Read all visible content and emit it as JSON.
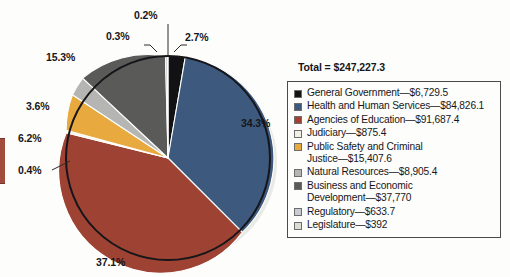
{
  "chart_data": {
    "type": "pie",
    "title": "",
    "total_label": "Total = $247,227.3",
    "total_value": 247227.3,
    "units": "thousands of dollars",
    "legend_position": "right",
    "grid": false,
    "categories": [
      "General Government",
      "Health and Human Services",
      "Agencies of Education",
      "Judiciary",
      "Public Safety and Criminal Justice",
      "Natural Resources",
      "Business and Economic Development",
      "Regulatory",
      "Legislature"
    ],
    "values": [
      6729.5,
      84826.1,
      91687.4,
      875.4,
      15407.6,
      8905.4,
      37770,
      633.7,
      392
    ],
    "value_labels": [
      "$6,729.5",
      "$84,826.1",
      "$91,687.4",
      "$875.4",
      "$15,407.6",
      "$8,905.4",
      "$37,770",
      "$633.7",
      "$392"
    ],
    "percents": [
      2.7,
      34.3,
      37.1,
      0.4,
      6.2,
      3.6,
      15.3,
      0.3,
      0.2
    ],
    "percent_labels": [
      "2.7%",
      "34.3%",
      "37.1%",
      "0.4%",
      "6.2%",
      "3.6%",
      "15.3%",
      "0.3%",
      "0.2%"
    ],
    "colors": [
      "#121214",
      "#3d5a7e",
      "#9e4334",
      "#f2f0e2",
      "#e8a93f",
      "#b5b5b3",
      "#5a5a58",
      "#c8ccd2",
      "#dcdcd0"
    ],
    "legend_entries": [
      {
        "label": "General Government—$6,729.5",
        "color": "#121214",
        "swatch_name": "swatch-general-government"
      },
      {
        "label": "Health and Human Services—$84,826.1",
        "color": "#3d5a7e",
        "swatch_name": "swatch-health-human-services"
      },
      {
        "label": "Agencies of Education—$91,687.4",
        "color": "#9e4334",
        "swatch_name": "swatch-agencies-of-education"
      },
      {
        "label": "Judiciary—$875.4",
        "color": "#f2f0e2",
        "swatch_name": "swatch-judiciary"
      },
      {
        "label": "Public Safety and Criminal\nJustice—$15,407.6",
        "color": "#e8a93f",
        "swatch_name": "swatch-public-safety-criminal-justice"
      },
      {
        "label": "Natural Resources—$8,905.4",
        "color": "#b5b5b3",
        "swatch_name": "swatch-natural-resources"
      },
      {
        "label": "Business and Economic\nDevelopment—$37,770",
        "color": "#5a5a58",
        "swatch_name": "swatch-business-economic-development"
      },
      {
        "label": "Regulatory—$633.7",
        "color": "#c8ccd2",
        "swatch_name": "swatch-regulatory"
      },
      {
        "label": "Legislature—$392",
        "color": "#dcdcd0",
        "swatch_name": "swatch-legislature"
      }
    ]
  },
  "pie_labels": {
    "p_34": "34.3%",
    "p_37": "37.1%",
    "p_15": "15.3%",
    "p_36": "3.6%",
    "p_62": "6.2%",
    "p_04": "0.4%",
    "p_03": "0.3%",
    "p_02": "0.2%",
    "p_27": "2.7%"
  }
}
